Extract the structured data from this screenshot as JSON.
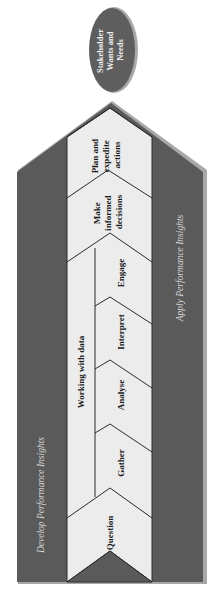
{
  "diagram": {
    "type": "process-arrow",
    "orientation": "bottom-to-top",
    "goal": {
      "label_lines": [
        "Stakeholder",
        "Wants and",
        "Needs"
      ]
    },
    "side_labels": {
      "left": "Develop Performance Insights",
      "right": "Apply Performance Insights"
    },
    "group_label": "Working with data",
    "steps": [
      {
        "id": "question",
        "label_lines": [
          "Question"
        ]
      },
      {
        "id": "gather",
        "label_lines": [
          "Gather"
        ]
      },
      {
        "id": "analyse",
        "label_lines": [
          "Analyse"
        ]
      },
      {
        "id": "interpret",
        "label_lines": [
          "Interpret"
        ]
      },
      {
        "id": "engage",
        "label_lines": [
          "Engage"
        ]
      },
      {
        "id": "decide",
        "label_lines": [
          "Make",
          "informed",
          "decisions"
        ]
      },
      {
        "id": "act",
        "label_lines": [
          "Plan and",
          "expedite",
          "actions"
        ]
      }
    ],
    "colors": {
      "arrow_dark": "#5a5a5a",
      "arrow_edge": "#a8a8a8",
      "chevron_fill": "#ececec",
      "line": "#2a2a2a",
      "oval_fill": "#5e5e5e",
      "side_text": "#d8d8d8"
    }
  }
}
